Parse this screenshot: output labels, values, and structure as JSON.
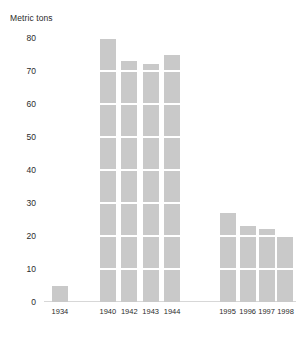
{
  "chart_data": {
    "type": "bar",
    "title": "Metric tons",
    "xlabel": "",
    "ylabel": "Metric tons",
    "categories": [
      "1934",
      "1940",
      "1942",
      "1943",
      "1944",
      "1995",
      "1996",
      "1997",
      "1998"
    ],
    "values": [
      5,
      80,
      73,
      72,
      75,
      27,
      23,
      22,
      20
    ],
    "ylim": [
      0,
      80
    ],
    "yticks": [
      0,
      10,
      20,
      30,
      40,
      50,
      60,
      70,
      80
    ],
    "ytick_labels": [
      "0",
      "10",
      "20",
      "30",
      "40",
      "50",
      "60",
      "70",
      "80"
    ],
    "grid": true,
    "grid_color": "#ffffff",
    "legend": null,
    "bar_color": "#c9c9c9",
    "background_color": "#ffffff",
    "text_color": "#2b2b2b",
    "series": [
      {
        "name": "Metric tons",
        "values": [
          5,
          80,
          73,
          72,
          75,
          27,
          23,
          22,
          20
        ]
      }
    ],
    "bar_positions_pct": [
      9.5,
      28.5,
      37.0,
      45.5,
      54.0,
      76.0,
      84.0,
      91.5,
      99.0
    ]
  }
}
